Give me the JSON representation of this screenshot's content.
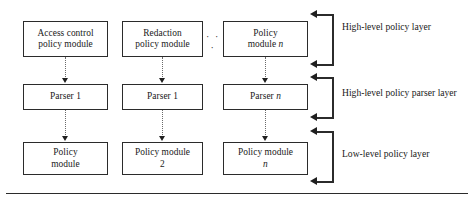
{
  "diagram": {
    "ellipsis": "· · ·",
    "colors": {
      "box_border": "#2b2b2b",
      "connector": "#6a6a6a",
      "arrow": "#1f1f1f",
      "text": "#1a1a1a",
      "background": "#ffffff"
    },
    "rows": [
      {
        "id": "high-level-policy-layer",
        "boxes": [
          {
            "line1": "Access control",
            "line2": "policy module"
          },
          {
            "line1": "Redaction",
            "line2": "policy module"
          },
          {
            "line1": "Policy",
            "line2": "module ",
            "italic": "n"
          }
        ]
      },
      {
        "id": "high-level-policy-parser-layer",
        "boxes": [
          {
            "line1": "Parser 1",
            "line2": ""
          },
          {
            "line1": "Parser 1",
            "line2": ""
          },
          {
            "line1": "Parser ",
            "line2": "",
            "italic": "n"
          }
        ]
      },
      {
        "id": "low-level-policy-layer",
        "boxes": [
          {
            "line1": "Policy",
            "line2": "module"
          },
          {
            "line1": "Policy module",
            "line2": "2"
          },
          {
            "line1": "Policy module",
            "line2": "",
            "italic": "n"
          }
        ]
      }
    ],
    "layer_labels": [
      "High-level policy layer",
      "High-level policy parser layer",
      "Low-level policy layer"
    ]
  }
}
